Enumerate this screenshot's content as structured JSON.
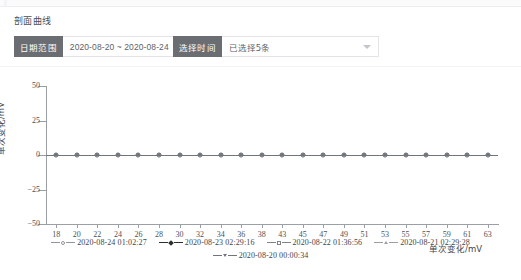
{
  "card": {
    "title": "剖面曲线"
  },
  "toolbar": {
    "date_range": {
      "label": "日期范围",
      "value": "2020-08-20 ~ 2020-08-24"
    },
    "time_select": {
      "label": "选择时间",
      "value": "已选择5条",
      "caret_icon": "chevron-down-icon"
    }
  },
  "chart_data": {
    "type": "line",
    "title": "",
    "xlabel": "单次变化/mV",
    "ylabel": "单次变化/mV",
    "ylim": [
      -50,
      50
    ],
    "yticks": [
      50,
      25,
      0,
      -25,
      -50
    ],
    "grid": false,
    "legend_position": "bottom",
    "categories": [
      "18",
      "20",
      "22",
      "24",
      "26",
      "28",
      "30",
      "32",
      "34",
      "36",
      "38",
      "43",
      "45",
      "47",
      "49",
      "51",
      "53",
      "55",
      "57",
      "59",
      "61",
      "63"
    ],
    "series": [
      {
        "name": "2020-08-24 01:02:27",
        "marker": "circle",
        "color": "#8f959b",
        "values": [
          0,
          0,
          0,
          0,
          0,
          0,
          0,
          0,
          0,
          0,
          0,
          0,
          0,
          0,
          0,
          0,
          0,
          0,
          0,
          0,
          0,
          0
        ]
      },
      {
        "name": "2020-08-23 02:29:16",
        "marker": "diamond-filled",
        "color": "#2b2f33",
        "values": [
          0,
          0,
          0,
          0,
          0,
          0,
          0,
          0,
          0,
          0,
          0,
          0,
          0,
          0,
          0,
          0,
          0,
          0,
          0,
          0,
          0,
          0
        ]
      },
      {
        "name": "2020-08-22 01:36:56",
        "marker": "square",
        "color": "#7e848a",
        "values": [
          0,
          0,
          0,
          0,
          0,
          0,
          0,
          0,
          0,
          0,
          0,
          0,
          0,
          0,
          0,
          0,
          0,
          0,
          0,
          0,
          0,
          0
        ]
      },
      {
        "name": "2020-08-21 02:29:28",
        "marker": "triangle-up",
        "color": "#9aa0a6",
        "values": [
          0,
          0,
          0,
          0,
          0,
          0,
          0,
          0,
          0,
          0,
          0,
          0,
          0,
          0,
          0,
          0,
          0,
          0,
          0,
          0,
          0,
          0
        ]
      },
      {
        "name": "2020-08-20 00:00:34",
        "marker": "triangle-down",
        "color": "#6f757b",
        "values": [
          0,
          0,
          0,
          0,
          0,
          0,
          0,
          0,
          0,
          0,
          0,
          0,
          0,
          0,
          0,
          0,
          0,
          0,
          0,
          0,
          0,
          0
        ]
      }
    ]
  }
}
